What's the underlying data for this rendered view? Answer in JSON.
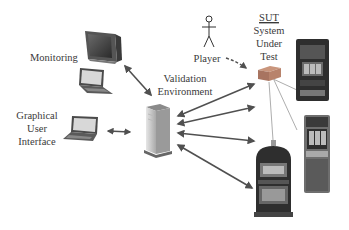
{
  "labels": {
    "monitoring": "Monitoring",
    "gui": [
      "Graphical",
      "User",
      "Interface"
    ],
    "validation": [
      "Validation",
      "Environment"
    ],
    "player": "Player",
    "sut_abbrev": "SUT",
    "sut": [
      "System",
      "Under",
      "Test"
    ]
  },
  "colors": {
    "arrow": "#505050",
    "text": "#3a3a3a",
    "sut_box": "#b38068",
    "machine_dark": "#2e2e2e",
    "screen_light": "#d8d8d8"
  },
  "nodes": [
    {
      "id": "monitor",
      "kind": "crt-monitor"
    },
    {
      "id": "laptop-top",
      "kind": "laptop"
    },
    {
      "id": "laptop-gui",
      "kind": "laptop"
    },
    {
      "id": "server",
      "kind": "tower-server"
    },
    {
      "id": "player",
      "kind": "stick-figure"
    },
    {
      "id": "sut-box",
      "kind": "device-box"
    },
    {
      "id": "slot-machine-1",
      "kind": "slot-machine"
    },
    {
      "id": "slot-machine-2",
      "kind": "slot-machine"
    },
    {
      "id": "slot-machine-3",
      "kind": "slot-machine"
    }
  ],
  "edges": [
    {
      "from": "monitor",
      "to": "server",
      "style": "double-arrow"
    },
    {
      "from": "laptop-gui",
      "to": "server",
      "style": "double-arrow"
    },
    {
      "from": "server",
      "to": "sut-box",
      "style": "double-arrow"
    },
    {
      "from": "server",
      "to": "slot-machine-1",
      "style": "double-arrow"
    },
    {
      "from": "server",
      "to": "slot-machine-2",
      "style": "double-arrow"
    },
    {
      "from": "server",
      "to": "slot-machine-3",
      "style": "double-arrow"
    },
    {
      "from": "player",
      "to": "sut-box",
      "style": "dashed-arrow"
    },
    {
      "from": "sut-box",
      "to": "slot-machine-1",
      "style": "thin-line"
    },
    {
      "from": "sut-box",
      "to": "slot-machine-2",
      "style": "thin-line"
    },
    {
      "from": "sut-box",
      "to": "slot-machine-3",
      "style": "thin-line"
    }
  ]
}
